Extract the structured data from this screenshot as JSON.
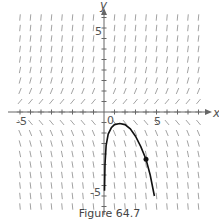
{
  "figure": {
    "caption": "Figure 64.7",
    "x_axis_label": "x",
    "y_axis_label": "y",
    "origin_label": "0",
    "x_tick_labels": [
      {
        "value": -5,
        "text": "-5"
      },
      {
        "value": 5,
        "text": "5"
      }
    ],
    "y_tick_labels": [
      {
        "value": 5,
        "text": "5"
      },
      {
        "value": -5,
        "text": "-5"
      }
    ],
    "x_range": [
      -9,
      10
    ],
    "y_range": [
      -9.5,
      10
    ],
    "slope_field": {
      "description": "direction field: segments slope up-right above x-axis, down-right below x-axis, near horizontal close to y=0",
      "grid_spacing": 1
    },
    "solution_curve": {
      "description": "solution curve starting near (0,-4.5), rising to max near (1.5,-1.1), then decreasing steeply",
      "marked_point": {
        "x": 4,
        "y": -4.5
      }
    },
    "colors": {
      "axis": "#666666",
      "field": "#888888",
      "curve": "#111111"
    }
  }
}
